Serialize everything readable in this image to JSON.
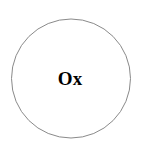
{
  "diagram": {
    "node": {
      "label": "Ox",
      "stroke_color": "#8a8a8a",
      "fill_color": "#ffffff",
      "text_color": "#000000"
    }
  }
}
